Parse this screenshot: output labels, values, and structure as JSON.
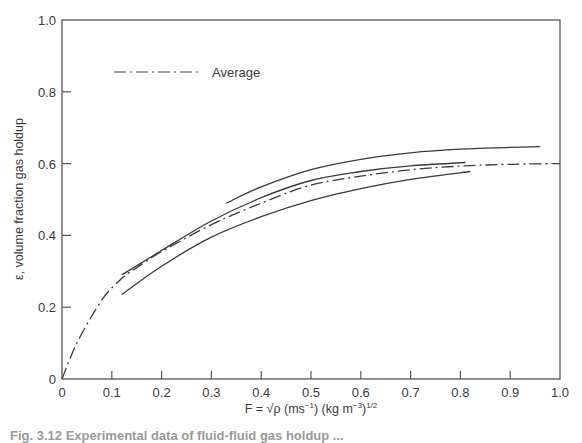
{
  "chart_data": {
    "type": "line",
    "title": "",
    "xlabel": "F = √ρ (ms⁻¹) (kg m⁻³)^1/2",
    "xlabel_parts": {
      "main": "F = √ρ (ms",
      "sup1": "−1",
      "mid": ") (kg m",
      "sup2": "−3",
      "end": ")",
      "sup3": "1/2"
    },
    "ylabel": "ε, volume fraction gas holdup",
    "xlim": [
      0,
      1.0
    ],
    "ylim": [
      0,
      1.0
    ],
    "x_ticks": [
      0,
      0.1,
      0.2,
      0.3,
      0.4,
      0.5,
      0.6,
      0.7,
      0.8,
      0.9,
      1.0
    ],
    "x_tick_labels": [
      "0",
      "0.1",
      "0.2",
      "0.3",
      "0.4",
      "0.5",
      "0.6",
      "0.7",
      "0.8",
      "0.9",
      "1.0"
    ],
    "y_ticks": [
      0,
      0.2,
      0.4,
      0.6,
      0.8,
      1.0
    ],
    "y_tick_labels": [
      "0",
      "0.2",
      "0.4",
      "0.6",
      "0.8",
      "1.0"
    ],
    "grid": false,
    "legend": {
      "position": "upper-left",
      "entries": [
        {
          "label": "Average",
          "style": "dash-dot"
        }
      ]
    },
    "series": [
      {
        "name": "Average",
        "style": "dash-dot",
        "x": [
          0,
          0.03,
          0.08,
          0.12,
          0.15,
          0.2,
          0.3,
          0.4,
          0.5,
          0.6,
          0.7,
          0.8,
          0.9,
          1.0
        ],
        "y": [
          0,
          0.1,
          0.22,
          0.28,
          0.31,
          0.355,
          0.43,
          0.49,
          0.54,
          0.565,
          0.583,
          0.593,
          0.598,
          0.6
        ]
      },
      {
        "name": "Curve 1 (upper)",
        "style": "solid",
        "x": [
          0.33,
          0.4,
          0.5,
          0.6,
          0.7,
          0.8,
          0.9,
          0.96
        ],
        "y": [
          0.49,
          0.535,
          0.583,
          0.612,
          0.63,
          0.64,
          0.645,
          0.647
        ]
      },
      {
        "name": "Curve 2 (middle)",
        "style": "solid",
        "x": [
          0.12,
          0.2,
          0.3,
          0.4,
          0.5,
          0.6,
          0.7,
          0.81
        ],
        "y": [
          0.29,
          0.358,
          0.44,
          0.505,
          0.553,
          0.578,
          0.594,
          0.603
        ]
      },
      {
        "name": "Curve 3 (lower)",
        "style": "solid",
        "x": [
          0.12,
          0.2,
          0.3,
          0.4,
          0.5,
          0.6,
          0.7,
          0.82
        ],
        "y": [
          0.235,
          0.314,
          0.395,
          0.452,
          0.497,
          0.53,
          0.556,
          0.578
        ]
      }
    ]
  },
  "caption": "Fig. 3.12  Experimental data of fluid-fluid gas holdup ..."
}
